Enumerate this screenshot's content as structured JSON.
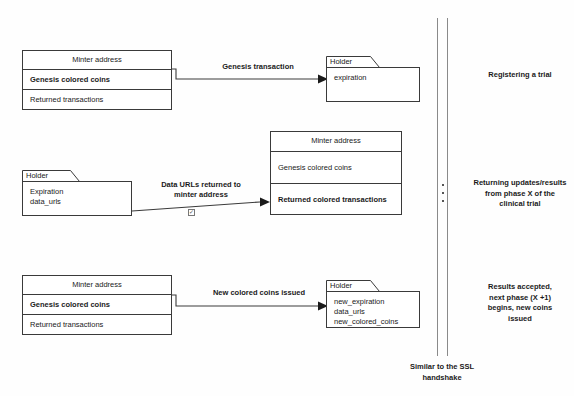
{
  "diagram": {
    "rows": [
      {
        "id": "row-registering",
        "left_box": {
          "kind": "class",
          "title": "Minter address",
          "rows": [
            {
              "label": "Genesis colored coins",
              "bold": true
            },
            {
              "label": "Returned transactions",
              "bold": false
            }
          ]
        },
        "arrow_label": "Genesis transaction",
        "right_box": {
          "kind": "folder",
          "tab": "Holder",
          "lines": [
            "expiration"
          ]
        },
        "note": "Registering a trial"
      },
      {
        "id": "row-returning",
        "left_box": {
          "kind": "folder",
          "tab": "Holder",
          "lines": [
            "Expiration",
            "data_urls"
          ]
        },
        "arrow_label": "Data URLs returned to\nminter address",
        "right_box": {
          "kind": "class",
          "title": "Minter address",
          "rows": [
            {
              "label": "Genesis colored coins",
              "bold": false
            },
            {
              "label": "Returned colored transactions",
              "bold": true
            }
          ]
        },
        "note": "Returning updates/results\nfrom phase X of the\nclinical trial"
      },
      {
        "id": "row-results",
        "left_box": {
          "kind": "class",
          "title": "Minter address",
          "rows": [
            {
              "label": "Genesis colored coins",
              "bold": true
            },
            {
              "label": "Returned transactions",
              "bold": false
            }
          ]
        },
        "arrow_label": "New colored coins issued",
        "right_box": {
          "kind": "folder",
          "tab": "Holder",
          "lines": [
            "new_expiration",
            "data_urls",
            "new_colored_coins"
          ]
        },
        "note": "Results accepted,\nnext phase (X +1)\nbegins, new coins\nissued"
      }
    ],
    "bottom_note": "Similar to the SSL\nhandshake",
    "marker_icon": "checkbox-icon",
    "colors": {
      "stroke": "#3a3a3a",
      "rail": "#8a8a8a",
      "text": "#1a1a1a",
      "background": "#fefefe"
    }
  }
}
